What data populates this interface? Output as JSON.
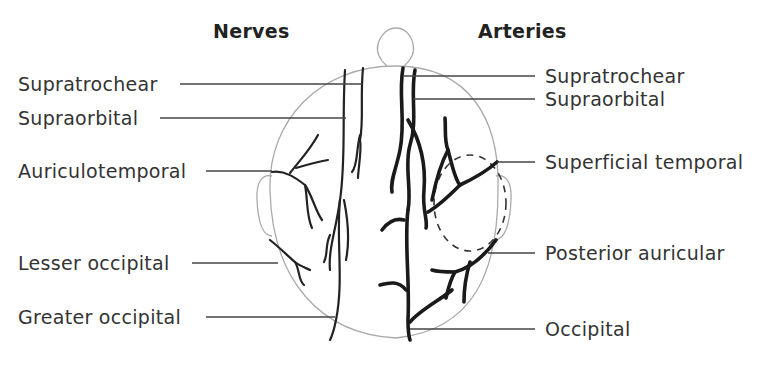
{
  "diagram": {
    "headings": {
      "nerves": "Nerves",
      "arteries": "Arteries"
    },
    "nerves": [
      {
        "label": "Supratrochear",
        "x": 18,
        "y": 73
      },
      {
        "label": "Supraorbital",
        "x": 18,
        "y": 107
      },
      {
        "label": "Auriculotemporal",
        "x": 18,
        "y": 160
      },
      {
        "label": "Lesser occipital",
        "x": 18,
        "y": 252
      },
      {
        "label": "Greater occipital",
        "x": 18,
        "y": 306
      }
    ],
    "arteries": [
      {
        "label": "Supratrochear",
        "x": 545,
        "y": 65
      },
      {
        "label": "Supraorbital",
        "x": 545,
        "y": 88
      },
      {
        "label": "Superficial temporal",
        "x": 545,
        "y": 151
      },
      {
        "label": "Posterior auricular",
        "x": 545,
        "y": 242
      },
      {
        "label": "Occipital",
        "x": 545,
        "y": 318
      }
    ],
    "colors": {
      "vessel": "#1c1c1c",
      "leader_line": "#444444",
      "outline": "#aaaaaa",
      "text": "#333333"
    }
  }
}
